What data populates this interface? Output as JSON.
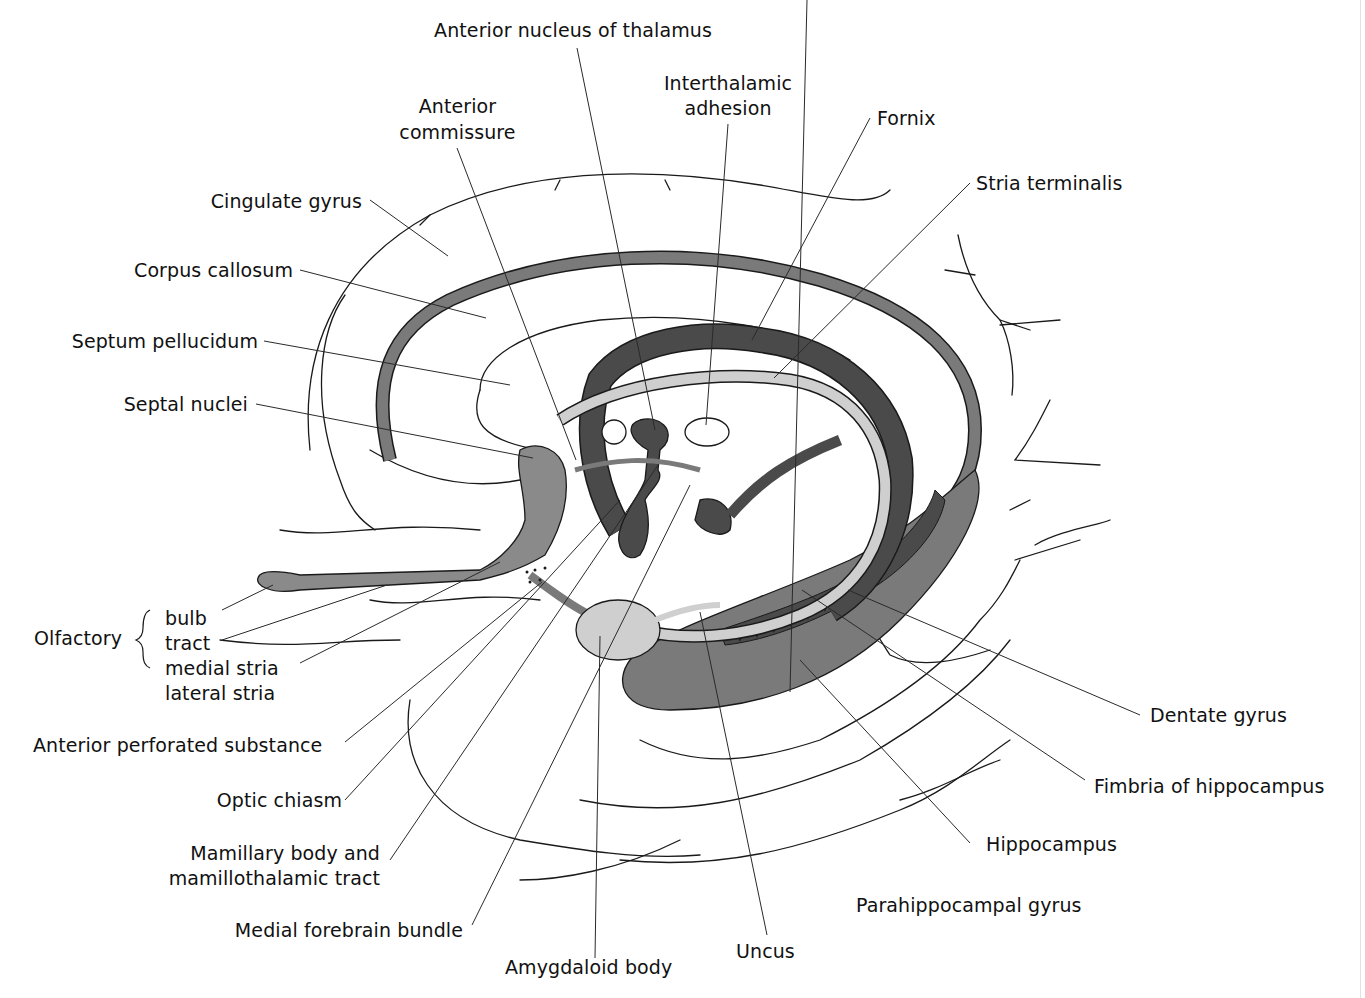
{
  "colors": {
    "dark_gray": "#4a4a4a",
    "mid_gray": "#7a7a7a",
    "light_gray": "#cfcfcf",
    "stroke": "#1a1a1a",
    "background": "#ffffff"
  },
  "labels": {
    "anterior_nucleus_thalamus": "Anterior nucleus of thalamus",
    "interthalamic_adhesion_1": "Interthalamic",
    "interthalamic_adhesion_2": "adhesion",
    "anterior_commissure_1": "Anterior",
    "anterior_commissure_2": "commissure",
    "fornix": "Fornix",
    "stria_terminalis": "Stria terminalis",
    "cingulate_gyrus": "Cingulate gyrus",
    "corpus_callosum": "Corpus callosum",
    "septum_pellucidum": "Septum pellucidum",
    "septal_nuclei": "Septal nuclei",
    "olfactory": "Olfactory",
    "olfactory_bulb": "bulb",
    "olfactory_tract": "tract",
    "olfactory_medial_stria": "medial stria",
    "olfactory_lateral_stria": "lateral stria",
    "anterior_perforated_substance": "Anterior perforated substance",
    "optic_chiasm": "Optic chiasm",
    "mamillary_body_1": "Mamillary body and",
    "mamillary_body_2": "mamillothalamic tract",
    "medial_forebrain_bundle": "Medial forebrain bundle",
    "amygdaloid_body": "Amygdaloid body",
    "uncus": "Uncus",
    "parahippocampal_gyrus": "Parahippocampal gyrus",
    "hippocampus": "Hippocampus",
    "fimbria_hippocampus": "Fimbria of hippocampus",
    "dentate_gyrus": "Dentate gyrus"
  }
}
